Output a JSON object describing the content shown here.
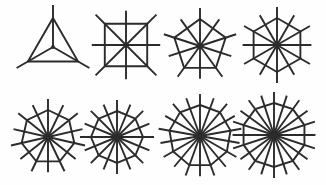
{
  "canvas": {
    "width": 326,
    "height": 185,
    "background_color": "#fefefe",
    "stroke_color": "#2b2b2b",
    "title": "Polygonal Spider Web Figures"
  },
  "figures": [
    {
      "name": "triangle-web",
      "label": "Triangle web",
      "sides": 3,
      "spokes": 3,
      "spoke_mode": "vertices",
      "center_x": 53,
      "center_y": 47,
      "radius": 29,
      "spoke_overshoot": 13,
      "rotation_deg": -90,
      "stroke_width": 1.9,
      "hub_radius": 1.9
    },
    {
      "name": "square-web",
      "label": "Square web",
      "sides": 4,
      "spokes": 8,
      "spoke_mode": "vertices-and-midpoints",
      "center_x": 126,
      "center_y": 45,
      "radius": 30,
      "spoke_overshoot": 13,
      "rotation_deg": -45,
      "stroke_width": 1.9,
      "hub_radius": 2.2
    },
    {
      "name": "pentagon-web",
      "label": "Pentagon web",
      "sides": 5,
      "spokes": 10,
      "spoke_mode": "vertices-and-midpoints",
      "center_x": 200,
      "center_y": 46,
      "radius": 27,
      "spoke_overshoot": 11,
      "rotation_deg": -90,
      "stroke_width": 1.9,
      "hub_radius": 2.4
    },
    {
      "name": "hexagon-web",
      "label": "Hexagon web",
      "sides": 6,
      "spokes": 12,
      "spoke_mode": "vertices-and-midpoints",
      "center_x": 277,
      "center_y": 45,
      "radius": 27,
      "spoke_overshoot": 11,
      "rotation_deg": -90,
      "stroke_width": 1.9,
      "hub_radius": 2.6
    },
    {
      "name": "heptagon-web",
      "label": "Heptagon web",
      "sides": 7,
      "spokes": 14,
      "spoke_mode": "vertices-and-midpoints",
      "center_x": 48,
      "center_y": 137,
      "radius": 27,
      "spoke_overshoot": 11,
      "rotation_deg": -90,
      "stroke_width": 1.9,
      "hub_radius": 2.8
    },
    {
      "name": "octagon-web",
      "label": "Octagon web",
      "sides": 8,
      "spokes": 16,
      "spoke_mode": "vertices-and-midpoints",
      "center_x": 117,
      "center_y": 137,
      "radius": 26,
      "spoke_overshoot": 11,
      "rotation_deg": -90,
      "stroke_width": 1.9,
      "hub_radius": 3.0
    },
    {
      "name": "nonagon-web",
      "label": "Nonagon web",
      "sides": 9,
      "spokes": 18,
      "spoke_mode": "vertices-and-midpoints",
      "center_x": 200,
      "center_y": 136,
      "radius": 31,
      "spoke_overshoot": 11,
      "rotation_deg": -90,
      "stroke_width": 1.9,
      "hub_radius": 3.2
    },
    {
      "name": "decagon-web",
      "label": "Decagon web",
      "sides": 10,
      "spokes": 20,
      "spoke_mode": "vertices-and-midpoints",
      "center_x": 274,
      "center_y": 135,
      "radius": 32,
      "spoke_overshoot": 11,
      "rotation_deg": -90,
      "stroke_width": 1.9,
      "hub_radius": 3.3
    }
  ]
}
